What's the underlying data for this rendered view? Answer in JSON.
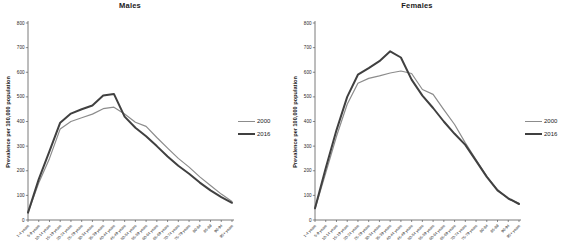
{
  "chart_data": [
    {
      "type": "line",
      "title": "Males",
      "xlabel": "",
      "ylabel": "Prevalence per 100,000 population",
      "ylim": [
        0,
        800
      ],
      "yticks": [
        0,
        100,
        200,
        300,
        400,
        500,
        600,
        700,
        800
      ],
      "grid": false,
      "legend_position": "right",
      "categories": [
        "1-4 years",
        "5-9 years",
        "10-14 years",
        "15-19 years",
        "20-24 years",
        "25-29 years",
        "30-34 years",
        "35-39 years",
        "40-44 years",
        "45-49 years",
        "50-54 years",
        "55-59 years",
        "60-64 years",
        "65-69 years",
        "70-74 years",
        "75-79 years",
        "80-84",
        "85-89",
        "90-94",
        "95+ years"
      ],
      "series": [
        {
          "name": "2000",
          "color": "#8c8c8c",
          "width": 1.2,
          "values": [
            30,
            150,
            250,
            370,
            400,
            415,
            430,
            452,
            458,
            430,
            397,
            380,
            335,
            292,
            250,
            215,
            175,
            140,
            105,
            75
          ]
        },
        {
          "name": "2016",
          "color": "#404040",
          "width": 2,
          "values": [
            30,
            165,
            280,
            395,
            432,
            450,
            465,
            505,
            512,
            420,
            375,
            340,
            300,
            258,
            220,
            188,
            152,
            120,
            93,
            70
          ]
        }
      ]
    },
    {
      "type": "line",
      "title": "Females",
      "xlabel": "",
      "ylabel": "Prevalence per 100,000 population",
      "ylim": [
        0,
        800
      ],
      "yticks": [
        0,
        100,
        200,
        300,
        400,
        500,
        600,
        700,
        800
      ],
      "grid": false,
      "legend_position": "right",
      "categories": [
        "1-4 years",
        "5-9 years",
        "10-14 years",
        "15-19 years",
        "20-24 years",
        "25-29 years",
        "30-34 years",
        "35-39 years",
        "40-44 years",
        "45-49 years",
        "50-54 years",
        "55-59 years",
        "60-64 years",
        "65-69 years",
        "70-74 years",
        "75-79 years",
        "80-84",
        "85-89",
        "90-94",
        "95+ years"
      ],
      "series": [
        {
          "name": "2000",
          "color": "#8c8c8c",
          "width": 1.2,
          "values": [
            45,
            190,
            340,
            470,
            555,
            575,
            585,
            597,
            605,
            595,
            530,
            510,
            448,
            388,
            313,
            245,
            177,
            123,
            85,
            68
          ]
        },
        {
          "name": "2016",
          "color": "#404040",
          "width": 2,
          "values": [
            48,
            210,
            365,
            500,
            590,
            617,
            645,
            685,
            660,
            570,
            505,
            455,
            400,
            350,
            305,
            240,
            175,
            120,
            88,
            65
          ]
        }
      ]
    }
  ],
  "style": {
    "axis_color": "#595959",
    "tick_label_color": "#262626",
    "background": "#ffffff"
  }
}
